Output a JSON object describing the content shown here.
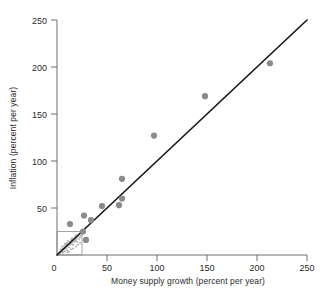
{
  "chart_data": {
    "type": "scatter",
    "title": "",
    "xlabel": "Money supply growth (percent per year)",
    "ylabel": "Inflation (percent per year)",
    "xlim": [
      0,
      250
    ],
    "ylim": [
      0,
      250
    ],
    "xticks": [
      0,
      50,
      100,
      150,
      200,
      250
    ],
    "yticks": [
      0,
      50,
      100,
      150,
      200,
      250
    ],
    "xtick_labels": [
      "0",
      "50",
      "100",
      "150",
      "200",
      "250"
    ],
    "ytick_labels": [
      "0",
      "50",
      "100",
      "150",
      "200",
      "250"
    ],
    "grid": false,
    "legend": null,
    "series": [
      {
        "name": "Countries",
        "marker": "circle",
        "color": "#8a8a8a",
        "points": [
          {
            "x": 13,
            "y": 33
          },
          {
            "x": 27,
            "y": 42
          },
          {
            "x": 26,
            "y": 25
          },
          {
            "x": 29,
            "y": 16
          },
          {
            "x": 34,
            "y": 37
          },
          {
            "x": 45,
            "y": 52
          },
          {
            "x": 62,
            "y": 53
          },
          {
            "x": 65,
            "y": 60
          },
          {
            "x": 65,
            "y": 81
          },
          {
            "x": 97,
            "y": 127
          },
          {
            "x": 148,
            "y": 169
          },
          {
            "x": 213,
            "y": 204
          }
        ]
      },
      {
        "name": "Low-inflation cluster (inset region)",
        "marker": "small-circle",
        "color": "#9a9a9a",
        "points": [
          {
            "x": 2,
            "y": 2
          },
          {
            "x": 3,
            "y": 4
          },
          {
            "x": 4,
            "y": 3
          },
          {
            "x": 4,
            "y": 6
          },
          {
            "x": 5,
            "y": 5
          },
          {
            "x": 5,
            "y": 9
          },
          {
            "x": 6,
            "y": 4
          },
          {
            "x": 6,
            "y": 7
          },
          {
            "x": 7,
            "y": 6
          },
          {
            "x": 7,
            "y": 10
          },
          {
            "x": 8,
            "y": 8
          },
          {
            "x": 8,
            "y": 12
          },
          {
            "x": 9,
            "y": 7
          },
          {
            "x": 9,
            "y": 11
          },
          {
            "x": 10,
            "y": 9
          },
          {
            "x": 10,
            "y": 13
          },
          {
            "x": 11,
            "y": 10
          },
          {
            "x": 11,
            "y": 15
          },
          {
            "x": 12,
            "y": 12
          },
          {
            "x": 12,
            "y": 8
          },
          {
            "x": 13,
            "y": 14
          },
          {
            "x": 13,
            "y": 11
          },
          {
            "x": 14,
            "y": 16
          },
          {
            "x": 14,
            "y": 12
          },
          {
            "x": 15,
            "y": 13
          },
          {
            "x": 15,
            "y": 18
          },
          {
            "x": 16,
            "y": 15
          },
          {
            "x": 16,
            "y": 11
          },
          {
            "x": 17,
            "y": 17
          },
          {
            "x": 17,
            "y": 14
          },
          {
            "x": 18,
            "y": 19
          },
          {
            "x": 18,
            "y": 15
          },
          {
            "x": 19,
            "y": 16
          },
          {
            "x": 19,
            "y": 21
          },
          {
            "x": 20,
            "y": 18
          },
          {
            "x": 20,
            "y": 14
          },
          {
            "x": 21,
            "y": 20
          },
          {
            "x": 22,
            "y": 17
          },
          {
            "x": 22,
            "y": 22
          },
          {
            "x": 23,
            "y": 19
          },
          {
            "x": 24,
            "y": 21
          },
          {
            "x": 6,
            "y": 2
          },
          {
            "x": 8,
            "y": 4
          },
          {
            "x": 10,
            "y": 5
          },
          {
            "x": 12,
            "y": 4
          },
          {
            "x": 14,
            "y": 6
          },
          {
            "x": 3,
            "y": 1
          },
          {
            "x": 16,
            "y": 7
          },
          {
            "x": 19,
            "y": 9
          },
          {
            "x": 21,
            "y": 11
          },
          {
            "x": 11,
            "y": 3
          },
          {
            "x": 23,
            "y": 13
          }
        ]
      }
    ],
    "trend_line": {
      "name": "45-degree reference line",
      "color": "#1a1a1a",
      "from": {
        "x": 0,
        "y": 0
      },
      "to": {
        "x": 250,
        "y": 250
      }
    },
    "inset_box": {
      "name": "magnified-region-outline",
      "x_range": [
        0,
        25
      ],
      "y_range": [
        0,
        25
      ]
    }
  }
}
